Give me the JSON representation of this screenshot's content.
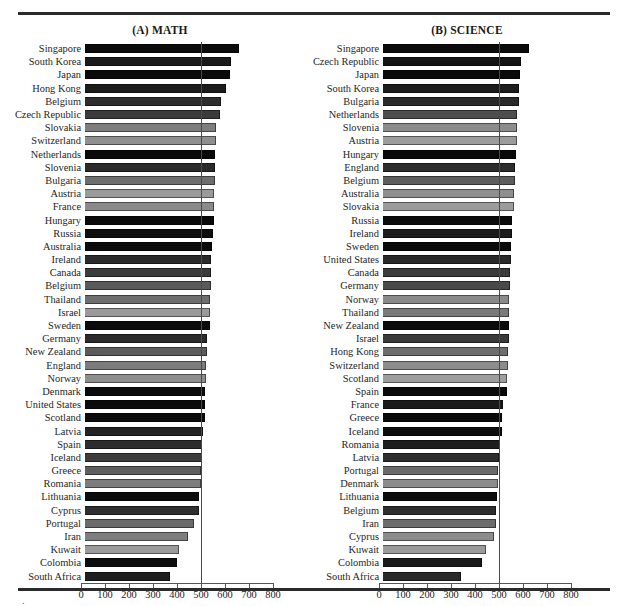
{
  "figure": {
    "panels": [
      {
        "id": "math",
        "title": "(A) MATH",
        "average_caption": "Average = 500"
      },
      {
        "id": "science",
        "title": "(B) SCIENCE",
        "average_caption": "Average = 500"
      }
    ],
    "footnote_mark": "."
  },
  "axis": {
    "ticks": [
      "0",
      "100",
      "200",
      "300",
      "400",
      "500",
      "600",
      "700",
      "800"
    ],
    "min": 0,
    "max": 800,
    "step": 100
  },
  "chart_data": [
    {
      "type": "bar",
      "title": "(A) MATH",
      "orientation": "horizontal",
      "xlabel": "",
      "ylabel": "",
      "xlim": [
        0,
        800
      ],
      "xticks": [
        0,
        100,
        200,
        300,
        400,
        500,
        600,
        700,
        800
      ],
      "grid": false,
      "legend": "none",
      "annotations": [
        "Average = 500"
      ],
      "reference_line": 500,
      "categories": [
        "Singapore",
        "South Korea",
        "Japan",
        "Hong Kong",
        "Belgium",
        "Czech Republic",
        "Slovakia",
        "Switzerland",
        "Netherlands",
        "Slovenia",
        "Bulgaria",
        "Austria",
        "France",
        "Hungary",
        "Russia",
        "Australia",
        "Ireland",
        "Canada",
        "Belgium",
        "Thailand",
        "Israel",
        "Sweden",
        "Germany",
        "New Zealand",
        "England",
        "Norway",
        "Denmark",
        "United States",
        "Scotland",
        "Latvia",
        "Spain",
        "Iceland",
        "Greece",
        "Romania",
        "Lithuania",
        "Cyprus",
        "Portugal",
        "Iran",
        "Kuwait",
        "Colombia",
        "South Africa"
      ],
      "values": [
        643,
        607,
        605,
        588,
        565,
        564,
        547,
        545,
        541,
        541,
        540,
        539,
        538,
        537,
        535,
        530,
        527,
        527,
        526,
        522,
        522,
        519,
        509,
        508,
        506,
        503,
        502,
        500,
        498,
        493,
        487,
        487,
        484,
        482,
        477,
        474,
        454,
        428,
        392,
        385,
        354
      ],
      "bar_shades": [
        "#0b0b0b",
        "#1b1b1b",
        "#0a0a0a",
        "#1c1c1c",
        "#2e2e2e",
        "#3b3b3b",
        "#7e7e7e",
        "#8f8f8f",
        "#0a0a0a",
        "#2a2a2a",
        "#6e6e6e",
        "#9a9a9a",
        "#8a8a8a",
        "#0a0a0a",
        "#0e0e0e",
        "#0b0b0b",
        "#2b2b2b",
        "#3c3c3c",
        "#5a5a5a",
        "#6e6e6e",
        "#9b9b9b",
        "#0b0b0b",
        "#2b2b2b",
        "#5c5c5c",
        "#7c7c7c",
        "#8e8e8e",
        "#0a0a0a",
        "#0b0b0b",
        "#0c0c0c",
        "#232323",
        "#2d2d2d",
        "#3c3c3c",
        "#5e5e5e",
        "#7d7d7d",
        "#0b0b0b",
        "#2f2f2f",
        "#6a6a6a",
        "#7e7e7e",
        "#9a9a9a",
        "#0d0d0d",
        "#1e1e1e"
      ]
    },
    {
      "type": "bar",
      "title": "(B) SCIENCE",
      "orientation": "horizontal",
      "xlabel": "",
      "ylabel": "",
      "xlim": [
        0,
        800
      ],
      "xticks": [
        0,
        100,
        200,
        300,
        400,
        500,
        600,
        700,
        800
      ],
      "grid": false,
      "legend": "none",
      "annotations": [
        "Average = 500"
      ],
      "reference_line": 500,
      "categories": [
        "Singapore",
        "Czech Republic",
        "Japan",
        "South Korea",
        "Bulgaria",
        "Netherlands",
        "Slovenia",
        "Austria",
        "Hungary",
        "England",
        "Belgium",
        "Australia",
        "Slovakia",
        "Russia",
        "Ireland",
        "Sweden",
        "United States",
        "Canada",
        "Germany",
        "Norway",
        "Thailand",
        "New Zealand",
        "Israel",
        "Hong Kong",
        "Switzerland",
        "Scotland",
        "Spain",
        "France",
        "Greece",
        "Iceland",
        "Romania",
        "Latvia",
        "Portugal",
        "Denmark",
        "Lithuania",
        "Belgium",
        "Iran",
        "Cyprus",
        "Kuwait",
        "Colombia",
        "South Africa"
      ],
      "values": [
        607,
        574,
        571,
        565,
        565,
        560,
        560,
        558,
        554,
        552,
        550,
        545,
        544,
        538,
        538,
        535,
        534,
        531,
        531,
        527,
        525,
        525,
        524,
        522,
        522,
        517,
        517,
        498,
        497,
        494,
        486,
        485,
        480,
        478,
        476,
        471,
        470,
        463,
        430,
        411,
        326
      ],
      "bar_shades": [
        "#0a0a0a",
        "#141414",
        "#0a0a0a",
        "#1d1d1d",
        "#2a2a2a",
        "#4e4e4e",
        "#8c8c8c",
        "#9c9c9c",
        "#0a0a0a",
        "#2c2c2c",
        "#5e5e5e",
        "#8e8e8e",
        "#9c9c9c",
        "#0b0b0b",
        "#1c1c1c",
        "#0a0a0a",
        "#2a2a2a",
        "#3a3a3a",
        "#4a4a4a",
        "#8a8a8a",
        "#7a7a7a",
        "#0b0b0b",
        "#3a3a3a",
        "#6e6e6e",
        "#8c8c8c",
        "#9e9e9e",
        "#0a0a0a",
        "#1a1a1a",
        "#0a0a0a",
        "#0d0d0d",
        "#1e1e1e",
        "#2e2e2e",
        "#6a6a6a",
        "#8c8c8c",
        "#0c0c0c",
        "#2e2e2e",
        "#6c6c6c",
        "#8c8c8c",
        "#9a9a9a",
        "#1a1a1a",
        "#2a2a2a"
      ]
    }
  ]
}
